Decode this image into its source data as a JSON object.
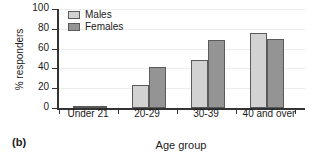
{
  "panel": {
    "label": "(b)"
  },
  "legend": {
    "position": "top-left-inside",
    "entries": [
      {
        "name": "Males",
        "color": "#d2d2d2"
      },
      {
        "name": "Females",
        "color": "#949494"
      }
    ]
  },
  "axes": {
    "yticks": [
      "0",
      "20",
      "40",
      "60",
      "80",
      "100"
    ],
    "ytick_values": [
      0,
      20,
      40,
      60,
      80,
      100
    ]
  },
  "chart_data": {
    "type": "bar",
    "title": "",
    "subtitle": "",
    "xlabel": "Age group",
    "ylabel": "% responders",
    "categories": [
      "Under 21",
      "20-29",
      "30-39",
      "40 and over"
    ],
    "series": [
      {
        "name": "Males",
        "color": "#d2d2d2",
        "values": [
          1,
          23,
          48,
          76
        ]
      },
      {
        "name": "Females",
        "color": "#949494",
        "values": [
          1,
          41,
          69,
          70
        ]
      }
    ],
    "ylim": [
      0,
      100
    ],
    "ytick_interval": 20,
    "grid": true,
    "grid_axis": "y",
    "legend": true,
    "legend_position": "top-left",
    "annotations": [
      "(b)"
    ]
  }
}
